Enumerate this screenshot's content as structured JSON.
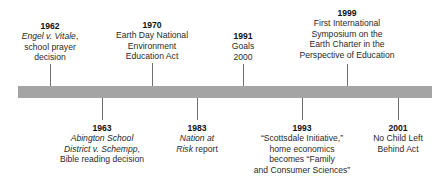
{
  "timeline": {
    "bar_color": "#a4a4a4",
    "tick_color": "#6e6e6e",
    "above": [
      {
        "year": "1962",
        "lines": [
          {
            "text": "Engel v. Vitale",
            "italic": true,
            "suffix": ","
          },
          {
            "text": "school prayer"
          },
          {
            "text": "decision"
          }
        ]
      },
      {
        "year": "1970",
        "lines": [
          {
            "text": "Earth Day National"
          },
          {
            "text": "Environment"
          },
          {
            "text": "Education Act"
          }
        ]
      },
      {
        "year": "1991",
        "lines": [
          {
            "text": "Goals"
          },
          {
            "text": "2000"
          }
        ]
      },
      {
        "year": "1999",
        "lines": [
          {
            "text": "First International"
          },
          {
            "text": "Symposium on the"
          },
          {
            "text": "Earth Charter in the"
          },
          {
            "text": "Perspective of Education"
          }
        ]
      }
    ],
    "below": [
      {
        "year": "1963",
        "lines": [
          {
            "text": "Abington School",
            "italic": true
          },
          {
            "text": "District v. Schempp",
            "italic": true,
            "suffix": ","
          },
          {
            "text": "Bible reading decision"
          }
        ]
      },
      {
        "year": "1983",
        "lines": [
          {
            "text": "Nation at",
            "italic": true
          },
          {
            "text": "Risk",
            "italic": true,
            "suffix": " report"
          }
        ]
      },
      {
        "year": "1993",
        "lines": [
          {
            "text": "“Scottsdale Initiative,”"
          },
          {
            "text": "home economics"
          },
          {
            "text": "becomes “Family"
          },
          {
            "text": "and Consumer Sciences”"
          }
        ]
      },
      {
        "year": "2001",
        "lines": [
          {
            "text": "No Child Left"
          },
          {
            "text": "Behind Act"
          }
        ]
      }
    ]
  }
}
